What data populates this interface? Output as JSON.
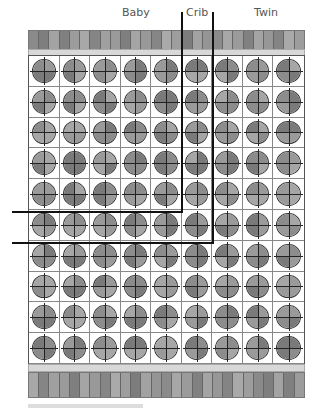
{
  "labels": {
    "baby": "Baby",
    "crib": "Crib",
    "twin": "Twin"
  },
  "grid": {
    "columns": 9,
    "rows": 10,
    "cell_fill_shades": [
      "#7a7a7a",
      "#8c8c8c",
      "#9a9a9a",
      "#a6a6a6"
    ]
  },
  "strips": {
    "stripe_count": 27,
    "stripe_shades": [
      "#8a8a8a",
      "#7e7e7e",
      "#a3a3a3",
      "#808080",
      "#9c9c9c",
      "#a8a8a8",
      "#858585",
      "#a0a0a0",
      "#9a9a9a",
      "#7f7f7f",
      "#a5a5a5",
      "#999999",
      "#868686",
      "#aaaaaa",
      "#9e9e9e",
      "#7c7c7c",
      "#a2a2a2",
      "#959595",
      "#8b8b8b",
      "#a7a7a7",
      "#9b9b9b",
      "#818181",
      "#a4a4a4",
      "#979797",
      "#848484",
      "#a9a9a9",
      "#9d9d9d"
    ]
  },
  "dividers": {
    "crib_left_x": 182,
    "crib_right_x": 213,
    "crib_row_boundary_y": 212,
    "twin_row_boundary_y": 243,
    "top_y": 12,
    "left_x": 12
  },
  "colors": {
    "line": "#111111",
    "band": "#d8d8d8",
    "cell_bg": "#ffffff"
  }
}
